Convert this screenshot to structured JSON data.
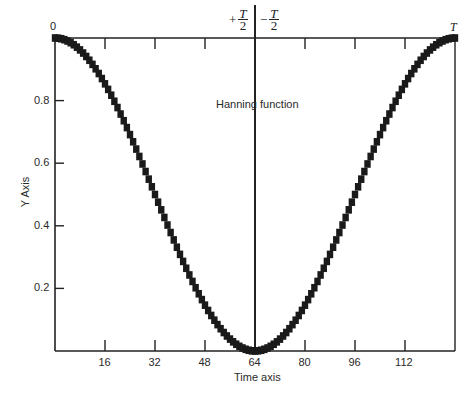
{
  "chart_data": {
    "type": "line",
    "title": "",
    "annotation": "Hanning function",
    "xlabel": "Time axis",
    "ylabel": "Y Axis",
    "xlim": [
      0,
      128
    ],
    "ylim": [
      0,
      1.0
    ],
    "x_ticks": [
      16,
      32,
      48,
      64,
      80,
      96,
      112
    ],
    "x_tick_labels": [
      "16",
      "32",
      "48",
      "64",
      "80",
      "96",
      "112"
    ],
    "y_ticks": [
      0.2,
      0.4,
      0.6,
      0.8
    ],
    "y_tick_labels": [
      "0.2",
      "0.4",
      "0.6",
      "0.8"
    ],
    "top_labels": {
      "left": "0",
      "center_left_sign": "+",
      "center_left_num": "T",
      "center_left_den": "2",
      "center_right_sign": "−",
      "center_right_num": "T",
      "center_right_den": "2",
      "right": "T"
    },
    "grid": false,
    "center_line_x": 64,
    "series": [
      {
        "name": "Hanning function",
        "formula": "0.5 + 0.5*cos(2*pi*n/128)",
        "x": [
          0,
          8,
          16,
          24,
          32,
          40,
          48,
          56,
          64,
          72,
          80,
          88,
          96,
          104,
          112,
          120,
          128
        ],
        "values": [
          1.0,
          0.962,
          0.854,
          0.691,
          0.5,
          0.309,
          0.146,
          0.038,
          0.0,
          0.038,
          0.146,
          0.309,
          0.5,
          0.691,
          0.854,
          0.962,
          1.0
        ]
      }
    ],
    "style": {
      "line_color": "#1a1a1a",
      "axis_color": "#222222",
      "marker": "square",
      "samples": 128
    }
  }
}
